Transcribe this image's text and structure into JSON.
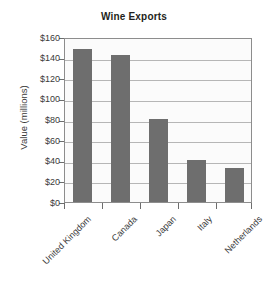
{
  "chart_data": {
    "type": "bar",
    "title": "Wine Exports",
    "xlabel": "",
    "ylabel": "Value (millions)",
    "categories": [
      "United Kingdom",
      "Canada",
      "Japan",
      "Italy",
      "Netherlands"
    ],
    "values": [
      150,
      144,
      81,
      41,
      33
    ],
    "ylim": [
      0,
      160
    ],
    "ytick_values": [
      0,
      20,
      40,
      60,
      80,
      100,
      120,
      140,
      160
    ],
    "ytick_labels": [
      "$0",
      "$20",
      "$40",
      "$60",
      "$80",
      "$100",
      "$120",
      "$140",
      "$160"
    ],
    "grid": "horizontal",
    "legend": "none",
    "bar_color": "#6e6e6e",
    "plot_background": "#fbfbfb",
    "axis_color": "#8d8d8d",
    "gridline_color": "#b6b6b6",
    "text_color": "#3a3a3a",
    "title_color": "#231f20"
  },
  "ticks": {
    "t0": "$0",
    "t1": "$20",
    "t2": "$40",
    "t3": "$60",
    "t4": "$80",
    "t5": "$100",
    "t6": "$120",
    "t7": "$140",
    "t8": "$160"
  },
  "categories": {
    "c0": "United Kingdom",
    "c1": "Canada",
    "c2": "Japan",
    "c3": "Italy",
    "c4": "Netherlands"
  }
}
